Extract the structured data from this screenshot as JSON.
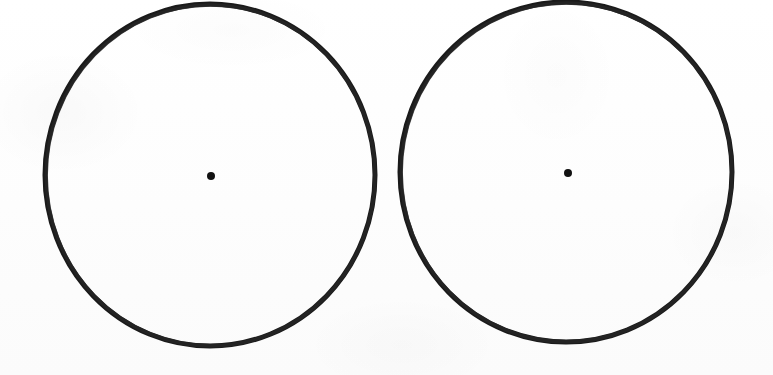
{
  "figure": {
    "title": "Two hand-drawn circles with marked centers",
    "medium": "scanned ink drawing on white paper",
    "background_color": "#fefefe",
    "ink_color": "#1a1a1a",
    "dot_color": "#111111",
    "canvas": {
      "width": 773,
      "height": 375
    },
    "shape_count": 2,
    "shapes": [
      {
        "name": "left-circle",
        "type": "circle",
        "center": {
          "x": 210,
          "y": 175
        },
        "radius_x": 165,
        "radius_y": 171,
        "stroke_width": 5,
        "stroke_color": "#1a1a1a",
        "fill": "none",
        "center_dot": {
          "name": "left-center-dot",
          "x": 211,
          "y": 176,
          "radius": 4,
          "color": "#111111"
        }
      },
      {
        "name": "right-circle",
        "type": "circle",
        "center": {
          "x": 566,
          "y": 172
        },
        "radius_x": 166,
        "radius_y": 170,
        "stroke_width": 5,
        "stroke_color": "#1a1a1a",
        "fill": "none",
        "center_dot": {
          "name": "right-center-dot",
          "x": 568,
          "y": 173,
          "radius": 4,
          "color": "#111111"
        }
      }
    ]
  }
}
